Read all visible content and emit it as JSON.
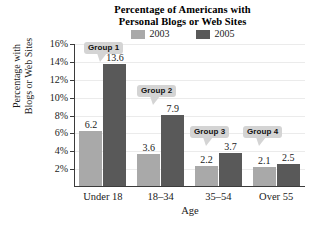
{
  "chart_data": {
    "type": "bar",
    "title": "Percentage of Americans with Personal Blogs or Web Sites",
    "title_lines": [
      "Percentage of Americans with",
      "Personal Blogs or Web Sites"
    ],
    "xlabel": "Age",
    "ylabel": "Percentage with Blogs or Web Sites",
    "ylabel_lines": [
      "Percentage with",
      "Blogs or Web Sites"
    ],
    "categories": [
      "Under 18",
      "18–34",
      "35–54",
      "Over 55"
    ],
    "series": [
      {
        "name": "2003",
        "color": "#a9a9a9",
        "values": [
          6.2,
          3.6,
          2.2,
          2.1
        ]
      },
      {
        "name": "2005",
        "color": "#595959",
        "values": [
          13.6,
          7.9,
          3.7,
          2.5
        ]
      }
    ],
    "value_labels": {
      "2003": [
        "6.2",
        "3.6",
        "2.2",
        "2.1"
      ],
      "2005": [
        "13.6",
        "7.9",
        "3.7",
        "2.5"
      ]
    },
    "ylim": [
      0,
      16
    ],
    "yticks": [
      2,
      4,
      6,
      8,
      10,
      12,
      14,
      16
    ],
    "ytick_labels": [
      "2%",
      "4%",
      "6%",
      "8%",
      "10%",
      "12%",
      "14%",
      "16%"
    ],
    "grid": true,
    "grid_color": "#ebebeb",
    "legend_position": "top-center",
    "annotations": [
      {
        "label": "Group 1",
        "target": "Under 18"
      },
      {
        "label": "Group 2",
        "target": "18–34"
      },
      {
        "label": "Group 3",
        "target": "35–54"
      },
      {
        "label": "Group 4",
        "target": "Over 55"
      }
    ]
  },
  "legend": {
    "items": [
      {
        "label": "2003",
        "color": "#a9a9a9"
      },
      {
        "label": "2005",
        "color": "#595959"
      }
    ]
  }
}
